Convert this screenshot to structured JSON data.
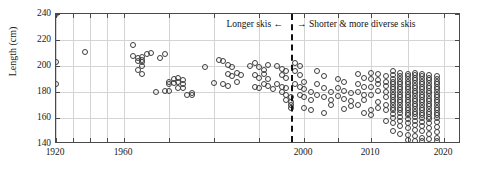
{
  "chart_data": {
    "type": "scatter",
    "title": "",
    "xlabel": "",
    "ylabel": "Length (cm)",
    "xlim": [
      1920,
      2020
    ],
    "ylim": [
      140,
      240
    ],
    "xticks": [
      1920,
      1930,
      1940,
      1950,
      1960,
      1970,
      1980,
      1990,
      2000,
      2005,
      2010,
      2015,
      2020
    ],
    "xticklabels_shown": [
      "1920",
      "1960",
      "2000",
      "2010",
      "2020"
    ],
    "yticks": [
      140,
      160,
      180,
      200,
      220,
      240
    ],
    "yticklabels": [
      "140",
      "160",
      "180",
      "200",
      "220",
      "240"
    ],
    "grid": true,
    "legend": "none",
    "marker": "open-circle",
    "marker_color": "#3d3d3d",
    "axis_color": "#4a4a4a",
    "grid_color": "#d4d4d4",
    "x_axis_scale": "piecewise-compressed-early-years",
    "annotations": [
      {
        "text": "Longer skis ←",
        "at_x": 1990,
        "at_y": 236,
        "align": "right"
      },
      {
        "text": "→ Shorter & more diverse skis",
        "at_x": 1998,
        "at_y": 236,
        "align": "left"
      }
    ],
    "reference_lines": [
      {
        "orientation": "vertical",
        "x": 1997,
        "style": "dashed",
        "color": "#111111"
      }
    ],
    "points": [
      [
        1920,
        240
      ],
      [
        1920,
        203
      ],
      [
        1920,
        186
      ],
      [
        1937,
        211
      ],
      [
        1962,
        216
      ],
      [
        1962,
        208
      ],
      [
        1963,
        206
      ],
      [
        1963,
        204
      ],
      [
        1964,
        207
      ],
      [
        1964,
        205
      ],
      [
        1964,
        203
      ],
      [
        1964,
        200
      ],
      [
        1965,
        209
      ],
      [
        1966,
        210
      ],
      [
        1963,
        197
      ],
      [
        1964,
        194
      ],
      [
        1968,
        206
      ],
      [
        1969,
        209
      ],
      [
        1970,
        188
      ],
      [
        1970,
        186
      ],
      [
        1971,
        190
      ],
      [
        1971,
        187
      ],
      [
        1972,
        191
      ],
      [
        1972,
        188
      ],
      [
        1973,
        189
      ],
      [
        1973,
        186
      ],
      [
        1967,
        180
      ],
      [
        1969,
        181
      ],
      [
        1970,
        181
      ],
      [
        1972,
        183
      ],
      [
        1973,
        183
      ],
      [
        1974,
        178
      ],
      [
        1975,
        179
      ],
      [
        1975,
        178
      ],
      [
        1978,
        199
      ],
      [
        1981,
        205
      ],
      [
        1982,
        204
      ],
      [
        1983,
        201
      ],
      [
        1984,
        199
      ],
      [
        1983,
        194
      ],
      [
        1984,
        192
      ],
      [
        1985,
        195
      ],
      [
        1986,
        193
      ],
      [
        1980,
        187
      ],
      [
        1982,
        186
      ],
      [
        1983,
        185
      ],
      [
        1985,
        188
      ],
      [
        1988,
        200
      ],
      [
        1989,
        202
      ],
      [
        1990,
        199
      ],
      [
        1991,
        197
      ],
      [
        1992,
        201
      ],
      [
        1989,
        193
      ],
      [
        1990,
        191
      ],
      [
        1991,
        194
      ],
      [
        1992,
        190
      ],
      [
        1989,
        184
      ],
      [
        1990,
        183
      ],
      [
        1991,
        186
      ],
      [
        1992,
        185
      ],
      [
        1993,
        182
      ],
      [
        1994,
        200
      ],
      [
        1995,
        198
      ],
      [
        1996,
        196
      ],
      [
        1995,
        193
      ],
      [
        1996,
        191
      ],
      [
        1994,
        186
      ],
      [
        1995,
        184
      ],
      [
        1996,
        183
      ],
      [
        1995,
        180
      ],
      [
        1996,
        178
      ],
      [
        1996,
        174
      ],
      [
        1997,
        176
      ],
      [
        1997,
        172
      ],
      [
        1997,
        170
      ],
      [
        1997,
        168
      ],
      [
        1998,
        202
      ],
      [
        1999,
        200
      ],
      [
        1998,
        196
      ],
      [
        1999,
        193
      ],
      [
        1998,
        186
      ],
      [
        1999,
        184
      ],
      [
        2000,
        188
      ],
      [
        2000,
        182
      ],
      [
        1999,
        178
      ],
      [
        2000,
        176
      ],
      [
        2001,
        180
      ],
      [
        2001,
        174
      ],
      [
        2000,
        168
      ],
      [
        2001,
        166
      ],
      [
        2002,
        196
      ],
      [
        2003,
        192
      ],
      [
        2002,
        186
      ],
      [
        2003,
        183
      ],
      [
        2002,
        178
      ],
      [
        2003,
        176
      ],
      [
        2004,
        180
      ],
      [
        2004,
        174
      ],
      [
        2003,
        164
      ],
      [
        2004,
        170
      ],
      [
        2005,
        190
      ],
      [
        2006,
        188
      ],
      [
        2005,
        183
      ],
      [
        2006,
        181
      ],
      [
        2005,
        177
      ],
      [
        2006,
        175
      ],
      [
        2007,
        179
      ],
      [
        2007,
        173
      ],
      [
        2006,
        167
      ],
      [
        2007,
        169
      ],
      [
        2008,
        194
      ],
      [
        2009,
        191
      ],
      [
        2008,
        186
      ],
      [
        2009,
        184
      ],
      [
        2008,
        180
      ],
      [
        2009,
        178
      ],
      [
        2009,
        174
      ],
      [
        2008,
        170
      ],
      [
        2009,
        164
      ],
      [
        2010,
        166
      ],
      [
        2010,
        195
      ],
      [
        2011,
        194
      ],
      [
        2010,
        190
      ],
      [
        2011,
        189
      ],
      [
        2012,
        192
      ],
      [
        2011,
        186
      ],
      [
        2012,
        185
      ],
      [
        2010,
        184
      ],
      [
        2012,
        188
      ],
      [
        2011,
        181
      ],
      [
        2012,
        180
      ],
      [
        2010,
        178
      ],
      [
        2012,
        176
      ],
      [
        2011,
        172
      ],
      [
        2012,
        170
      ],
      [
        2011,
        168
      ],
      [
        2012,
        166
      ],
      [
        2010,
        162
      ],
      [
        2012,
        158
      ],
      [
        2013,
        196
      ],
      [
        2013,
        193
      ],
      [
        2013,
        190
      ],
      [
        2013,
        188
      ],
      [
        2013,
        186
      ],
      [
        2013,
        184
      ],
      [
        2013,
        182
      ],
      [
        2013,
        180
      ],
      [
        2013,
        178
      ],
      [
        2013,
        176
      ],
      [
        2013,
        174
      ],
      [
        2013,
        172
      ],
      [
        2013,
        170
      ],
      [
        2013,
        168
      ],
      [
        2013,
        166
      ],
      [
        2013,
        163
      ],
      [
        2013,
        160
      ],
      [
        2013,
        156
      ],
      [
        2013,
        150
      ],
      [
        2014,
        195
      ],
      [
        2014,
        192
      ],
      [
        2014,
        190
      ],
      [
        2014,
        188
      ],
      [
        2014,
        186
      ],
      [
        2014,
        184
      ],
      [
        2014,
        182
      ],
      [
        2014,
        180
      ],
      [
        2014,
        178
      ],
      [
        2014,
        176
      ],
      [
        2014,
        174
      ],
      [
        2014,
        172
      ],
      [
        2014,
        170
      ],
      [
        2014,
        168
      ],
      [
        2014,
        166
      ],
      [
        2014,
        164
      ],
      [
        2014,
        161
      ],
      [
        2014,
        158
      ],
      [
        2014,
        154
      ],
      [
        2014,
        148
      ],
      [
        2015,
        194
      ],
      [
        2015,
        192
      ],
      [
        2015,
        190
      ],
      [
        2015,
        188
      ],
      [
        2015,
        186
      ],
      [
        2015,
        184
      ],
      [
        2015,
        182
      ],
      [
        2015,
        180
      ],
      [
        2015,
        178
      ],
      [
        2015,
        176
      ],
      [
        2015,
        174
      ],
      [
        2015,
        172
      ],
      [
        2015,
        170
      ],
      [
        2015,
        168
      ],
      [
        2015,
        166
      ],
      [
        2015,
        164
      ],
      [
        2015,
        162
      ],
      [
        2015,
        159
      ],
      [
        2015,
        156
      ],
      [
        2015,
        152
      ],
      [
        2015,
        147
      ],
      [
        2015,
        143
      ],
      [
        2016,
        195
      ],
      [
        2016,
        193
      ],
      [
        2016,
        191
      ],
      [
        2016,
        189
      ],
      [
        2016,
        187
      ],
      [
        2016,
        185
      ],
      [
        2016,
        183
      ],
      [
        2016,
        181
      ],
      [
        2016,
        179
      ],
      [
        2016,
        177
      ],
      [
        2016,
        175
      ],
      [
        2016,
        173
      ],
      [
        2016,
        171
      ],
      [
        2016,
        169
      ],
      [
        2016,
        167
      ],
      [
        2016,
        165
      ],
      [
        2016,
        163
      ],
      [
        2016,
        161
      ],
      [
        2016,
        158
      ],
      [
        2016,
        155
      ],
      [
        2016,
        151
      ],
      [
        2016,
        146
      ],
      [
        2016,
        142
      ],
      [
        2017,
        194
      ],
      [
        2017,
        192
      ],
      [
        2017,
        190
      ],
      [
        2017,
        188
      ],
      [
        2017,
        186
      ],
      [
        2017,
        184
      ],
      [
        2017,
        182
      ],
      [
        2017,
        180
      ],
      [
        2017,
        178
      ],
      [
        2017,
        176
      ],
      [
        2017,
        174
      ],
      [
        2017,
        172
      ],
      [
        2017,
        170
      ],
      [
        2017,
        168
      ],
      [
        2017,
        166
      ],
      [
        2017,
        164
      ],
      [
        2017,
        162
      ],
      [
        2017,
        160
      ],
      [
        2017,
        157
      ],
      [
        2017,
        154
      ],
      [
        2017,
        150
      ],
      [
        2017,
        145
      ],
      [
        2017,
        142
      ],
      [
        2018,
        193
      ],
      [
        2018,
        191
      ],
      [
        2018,
        189
      ],
      [
        2018,
        187
      ],
      [
        2018,
        185
      ],
      [
        2018,
        183
      ],
      [
        2018,
        181
      ],
      [
        2018,
        179
      ],
      [
        2018,
        177
      ],
      [
        2018,
        175
      ],
      [
        2018,
        173
      ],
      [
        2018,
        171
      ],
      [
        2018,
        169
      ],
      [
        2018,
        167
      ],
      [
        2018,
        165
      ],
      [
        2018,
        163
      ],
      [
        2018,
        161
      ],
      [
        2018,
        159
      ],
      [
        2018,
        156
      ],
      [
        2018,
        152
      ],
      [
        2018,
        148
      ],
      [
        2018,
        144
      ],
      [
        2019,
        192
      ],
      [
        2019,
        190
      ],
      [
        2019,
        188
      ],
      [
        2019,
        186
      ],
      [
        2019,
        184
      ],
      [
        2019,
        182
      ],
      [
        2019,
        180
      ],
      [
        2019,
        178
      ],
      [
        2019,
        176
      ],
      [
        2019,
        174
      ],
      [
        2019,
        172
      ],
      [
        2019,
        170
      ],
      [
        2019,
        168
      ],
      [
        2019,
        166
      ],
      [
        2019,
        164
      ],
      [
        2019,
        162
      ],
      [
        2019,
        160
      ],
      [
        2019,
        157
      ],
      [
        2019,
        153
      ],
      [
        2019,
        149
      ],
      [
        2019,
        145
      ],
      [
        2019,
        142
      ]
    ]
  }
}
